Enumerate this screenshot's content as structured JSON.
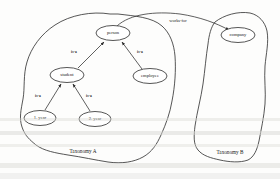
{
  "figure": {
    "name": "taxonomy-mapping-diagram",
    "background_color": "#fdfdfc",
    "ink_color": "#2b2b2b"
  },
  "groups": [
    {
      "id": "taxonomy_a",
      "label": "Taxonomy A",
      "label_x": 83,
      "label_y": 152
    },
    {
      "id": "taxonomy_b",
      "label": "Taxonomy B",
      "label_x": 230,
      "label_y": 153
    }
  ],
  "nodes": [
    {
      "id": "person",
      "label": "person",
      "group": "taxonomy_a",
      "cx": 113,
      "cy": 33,
      "rx": 17,
      "ry": 7.5
    },
    {
      "id": "student",
      "label": "student",
      "group": "taxonomy_a",
      "cx": 67,
      "cy": 75,
      "rx": 17,
      "ry": 7.5
    },
    {
      "id": "employee",
      "label": "employee",
      "group": "taxonomy_a",
      "cx": 150,
      "cy": 76,
      "rx": 17,
      "ry": 7.5
    },
    {
      "id": "year1",
      "label": "1. year",
      "group": "taxonomy_a",
      "cx": 40,
      "cy": 118,
      "rx": 16,
      "ry": 7.5
    },
    {
      "id": "year2",
      "label": "2. year",
      "group": "taxonomy_a",
      "cx": 95,
      "cy": 119,
      "rx": 16,
      "ry": 7.5
    },
    {
      "id": "company",
      "label": "company",
      "group": "taxonomy_b",
      "cx": 238,
      "cy": 35,
      "rx": 17,
      "ry": 7.5
    }
  ],
  "edges": [
    {
      "id": "student-isa-person",
      "from": "student",
      "to": "person",
      "label": "is-a",
      "label_x": 74,
      "label_y": 52
    },
    {
      "id": "employee-isa-person",
      "from": "employee",
      "to": "person",
      "label": "is-a",
      "label_x": 140,
      "label_y": 52
    },
    {
      "id": "year1-isa-student",
      "from": "year1",
      "to": "student",
      "label": "is-a",
      "label_x": 38,
      "label_y": 96
    },
    {
      "id": "year2-isa-student",
      "from": "year2",
      "to": "student",
      "label": "is-a",
      "label_x": 89,
      "label_y": 96
    },
    {
      "id": "person-worksfor-company",
      "from": "person",
      "to": "company",
      "label": "works-for",
      "label_x": 178,
      "label_y": 21
    }
  ]
}
